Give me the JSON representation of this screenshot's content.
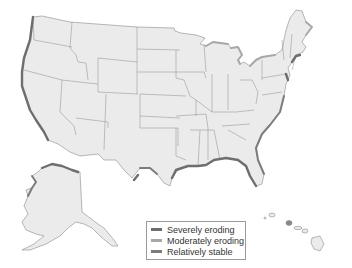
{
  "map": {
    "subject": "United States coastline erosion",
    "regions_shown": [
      "Contiguous United States",
      "Alaska",
      "Hawaii"
    ]
  },
  "legend": {
    "items": [
      {
        "label": "Severely eroding",
        "color": "#6e6e6e"
      },
      {
        "label": "Moderately eroding",
        "color": "#a8a8a8"
      },
      {
        "label": "Relatively stable",
        "color": "#7c7c7c"
      }
    ]
  },
  "colors": {
    "land": "#ebebeb",
    "border": "#8a8a8a",
    "background": "#ffffff"
  }
}
